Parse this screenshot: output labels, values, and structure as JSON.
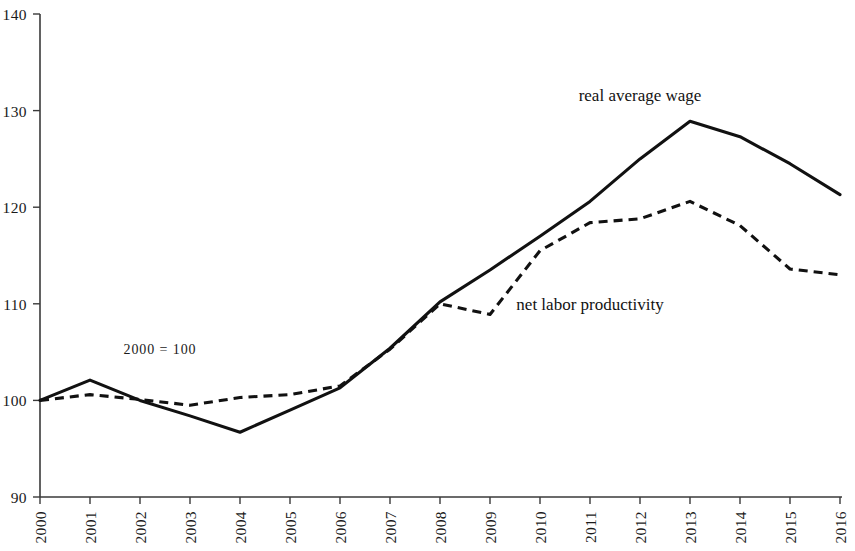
{
  "chart_data": {
    "type": "line",
    "title": "",
    "subtitle": "",
    "xlabel": "",
    "ylabel": "",
    "annotation": "2000 = 100",
    "xlim": [
      2000,
      2016
    ],
    "ylim": [
      90,
      140
    ],
    "yticks": [
      90,
      100,
      110,
      120,
      130,
      140
    ],
    "ytick_labels": [
      "90",
      "100",
      "110",
      "120",
      "130",
      "140"
    ],
    "grid": false,
    "legend_position": "inline-labels",
    "categories": [
      2000,
      2001,
      2002,
      2003,
      2004,
      2005,
      2006,
      2007,
      2008,
      2009,
      2010,
      2011,
      2012,
      2013,
      2014,
      2015,
      2016
    ],
    "xtick_labels": [
      "2000",
      "2001",
      "2002",
      "2003",
      "2004",
      "2005",
      "2006",
      "2007",
      "2008",
      "2009",
      "2010",
      "2011",
      "2012",
      "2013",
      "2014",
      "2015",
      "2016"
    ],
    "series": [
      {
        "name": "real average wage",
        "style": "solid",
        "color": "#111111",
        "label_x": 2012.0,
        "label_y": 131.0,
        "values": [
          100.0,
          102.1,
          100.0,
          98.4,
          96.7,
          99.0,
          101.3,
          105.4,
          110.2,
          113.5,
          117.0,
          120.6,
          125.0,
          128.9,
          127.3,
          124.5,
          121.3
        ]
      },
      {
        "name": "net labor productivity",
        "style": "dashed",
        "color": "#111111",
        "label_x": 2011.0,
        "label_y": 109.4,
        "values": [
          100.0,
          100.6,
          100.1,
          99.5,
          100.3,
          100.6,
          101.5,
          105.3,
          110.0,
          108.9,
          115.5,
          118.4,
          118.8,
          120.6,
          118.1,
          113.6,
          113.0
        ]
      }
    ]
  }
}
